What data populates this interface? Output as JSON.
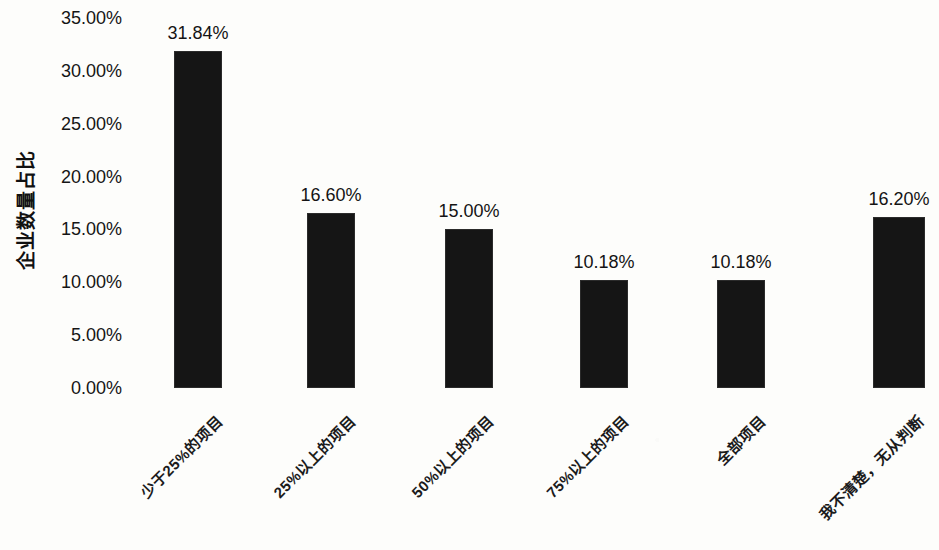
{
  "chart_data": {
    "type": "bar",
    "title": "",
    "xlabel": "",
    "ylabel": "企业数量占比",
    "ylim": [
      0,
      35
    ],
    "ytick_labels": [
      "35.00%",
      "30.00%",
      "25.00%",
      "20.00%",
      "15.00%",
      "10.00%",
      "5.00%",
      "0.00%"
    ],
    "ytick_values": [
      35,
      30,
      25,
      20,
      15,
      10,
      5,
      0
    ],
    "grid": false,
    "legend": false,
    "categories": [
      "少于25%的项目",
      "25%以上的项目",
      "50%以上的项目",
      "75%以上的项目",
      "全部项目",
      "我不清楚，无从判断"
    ],
    "values": [
      31.84,
      16.6,
      15.0,
      10.18,
      10.18,
      16.2
    ],
    "value_labels": [
      "31.84%",
      "16.60%",
      "15.00%",
      "10.18%",
      "10.18%",
      "16.20%"
    ],
    "bar_color": "#151515",
    "background_color": "#fdfdfb"
  }
}
